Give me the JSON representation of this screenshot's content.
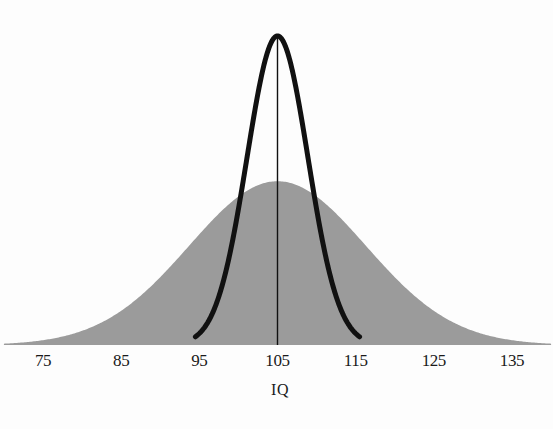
{
  "chart_data": {
    "type": "area",
    "title": "",
    "subtitle": "",
    "xlabel": "IQ",
    "ylabel": "",
    "xlim": [
      70,
      140
    ],
    "ylim": [
      0,
      1
    ],
    "grid": false,
    "legend": "none",
    "x_tick_labels": [
      "75",
      "85",
      "95",
      "105",
      "115",
      "125",
      "135"
    ],
    "x_tick_values": [
      75,
      85,
      95,
      105,
      115,
      125,
      135
    ],
    "annotations": [],
    "series": [
      {
        "name": "population-distribution",
        "shape": "normal",
        "mean": 105,
        "sd": 11.3,
        "peak_height": 0.53,
        "style": "filled-area",
        "color": "#9b9b9b",
        "x_start": 70,
        "x_end": 140
      },
      {
        "name": "narrow-distribution",
        "shape": "normal",
        "mean": 105,
        "sd": 3.9,
        "peak_height": 1.0,
        "style": "outline-curve",
        "color": "#111111",
        "stroke_width": 5,
        "x_start": 94.5,
        "x_end": 115.5
      },
      {
        "name": "mean-line",
        "shape": "vertical-line",
        "x": 105,
        "style": "thin-line",
        "color": "#111111",
        "stroke_width": 1.4
      }
    ]
  },
  "axis": {
    "title": "IQ",
    "ticks": [
      {
        "label": "75",
        "value": 75
      },
      {
        "label": "85",
        "value": 85
      },
      {
        "label": "95",
        "value": 95
      },
      {
        "label": "105",
        "value": 105
      },
      {
        "label": "115",
        "value": 115
      },
      {
        "label": "125",
        "value": 125
      },
      {
        "label": "135",
        "value": 135
      }
    ]
  },
  "colors": {
    "background": "#fdfdfd",
    "area_fill": "#9b9b9b",
    "curve_stroke": "#111111",
    "text": "#1a1a1a"
  }
}
